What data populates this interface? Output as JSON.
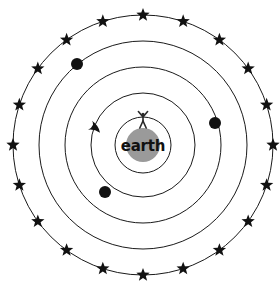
{
  "diagram": {
    "center_label": "earth",
    "background_color": "#ffffff",
    "line_color": "#1a1a1a",
    "earth_color": "#9a9a9a",
    "dot_color": "#111111",
    "star_color": "#111111",
    "center": {
      "x": 143,
      "y": 145
    },
    "orbits": [
      {
        "name": "orbit-1-innermost",
        "radius": 28
      },
      {
        "name": "orbit-2",
        "radius": 52
      },
      {
        "name": "orbit-3",
        "radius": 78
      },
      {
        "name": "orbit-4",
        "radius": 104
      },
      {
        "name": "orbit-5-outermost-stars",
        "radius": 130
      }
    ],
    "earth_radius": 17,
    "planets": [
      {
        "name": "planet-upper-left",
        "x": 77,
        "y": 64,
        "radius": 6,
        "orbit": 4
      },
      {
        "name": "planet-right",
        "x": 215,
        "y": 123,
        "radius": 6,
        "orbit": 3
      },
      {
        "name": "planet-lower-left",
        "x": 105,
        "y": 192,
        "radius": 6,
        "orbit": 2
      }
    ],
    "direction_arrow": {
      "name": "counterclockwise-rotation-arrow",
      "orbit": 2,
      "angle_deg": 196,
      "direction": "counterclockwise"
    },
    "stars": {
      "count": 20,
      "radius_on_orbit": 130,
      "glyph_size": 7,
      "start_angle_deg": -90
    },
    "figure": {
      "name": "human-figure",
      "description": "stick person with raised arms standing on earth"
    }
  }
}
